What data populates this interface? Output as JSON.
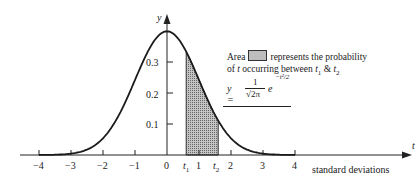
{
  "chart_data": {
    "type": "area",
    "title": "",
    "xlabel": "standard deviations",
    "ylabel": "y",
    "x_axis_symbol": "t",
    "xlim": [
      -4,
      4
    ],
    "ylim": [
      0,
      0.4
    ],
    "x_ticks": [
      "-4",
      "-3",
      "-2",
      "-1",
      "0",
      "1",
      "2",
      "3",
      "4"
    ],
    "y_ticks": [
      "0.1",
      "0.2",
      "0.3"
    ],
    "grid": false,
    "series": [
      {
        "name": "standard normal density",
        "x": [
          -4,
          -3,
          -2,
          -1,
          0,
          1,
          2,
          3,
          4
        ],
        "values": [
          0.0001,
          0.0044,
          0.054,
          0.242,
          0.399,
          0.242,
          0.054,
          0.0044,
          0.0001
        ]
      }
    ],
    "shaded_region": {
      "from_label": "t1",
      "to_label": "t2",
      "from": 0.6,
      "to": 1.6
    },
    "annotations": {
      "t1_label": "t",
      "t1_sub": "1",
      "t2_label": "t",
      "t2_sub": "2",
      "legend_area_word": "Area",
      "legend_line1_rest": "represents the probability",
      "legend_line2": "of t occurring between t₁ & t₂",
      "formula": "y = 1/√(2π) e^(-t²/2)"
    }
  },
  "labels": {
    "y_axis": "y",
    "t_axis": "t",
    "x_title": "standard deviations",
    "x_ticks": [
      {
        "v": -4,
        "text": "−4"
      },
      {
        "v": -3,
        "text": "−3"
      },
      {
        "v": -2,
        "text": "−2"
      },
      {
        "v": -1,
        "text": "−1"
      },
      {
        "v": 0,
        "text": "0"
      },
      {
        "v": 1,
        "text": "1"
      },
      {
        "v": 2,
        "text": "2"
      },
      {
        "v": 3,
        "text": "3"
      },
      {
        "v": 4,
        "text": "4"
      }
    ],
    "y_ticks": [
      "0.1",
      "0.2",
      "0.3"
    ],
    "t1": "t",
    "t1_sub": "1",
    "t2": "t",
    "t2_sub": "2",
    "legend_area": "Area",
    "legend_rest": "represents the probability",
    "legend_line2_pre": "of",
    "legend_line2_t": "t",
    "legend_line2_mid": "occurring between",
    "legend_amp": "&",
    "formula_y": "y =",
    "formula_num": "1",
    "formula_den": "√2π",
    "formula_e": "e",
    "formula_exp": "−t²/2"
  }
}
